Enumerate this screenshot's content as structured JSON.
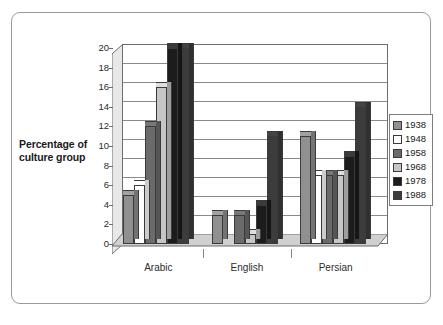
{
  "chart_data": {
    "type": "bar",
    "title": "",
    "subtitle": "",
    "xlabel": "",
    "ylabel": "Percentage of culture group",
    "ylabel_lines": [
      "Percentage of",
      "culture group"
    ],
    "categories": [
      "Arabic",
      "English",
      "Persian"
    ],
    "series": [
      {
        "name": "1938",
        "color": "#909090",
        "values": [
          5,
          3,
          11
        ]
      },
      {
        "name": "1948",
        "color": "#ffffff",
        "values": [
          6,
          0,
          7
        ]
      },
      {
        "name": "1958",
        "color": "#6b6b6b",
        "values": [
          12,
          3,
          7
        ]
      },
      {
        "name": "1968",
        "color": "#c6c6c6",
        "values": [
          16,
          1,
          7
        ]
      },
      {
        "name": "1978",
        "color": "#1c1c1c",
        "values": [
          20,
          4,
          9
        ]
      },
      {
        "name": "1988",
        "color": "#3c3c3c",
        "values": [
          20,
          11,
          14
        ]
      }
    ],
    "ylim": [
      0,
      20
    ],
    "ytick_step": 2,
    "yticks": [
      "0",
      "2",
      "4",
      "6",
      "8",
      "10",
      "12",
      "14",
      "16",
      "18",
      "20"
    ],
    "grid": true,
    "legend_position": "right",
    "legend_entries": [
      "1938",
      "1948",
      "1958",
      "1968",
      "1978",
      "1988"
    ],
    "style": "3d-clustered-column"
  }
}
